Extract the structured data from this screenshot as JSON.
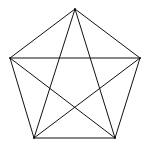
{
  "diagram": {
    "title": "",
    "type": "complete-graph-K5",
    "stroke_color": "#111111",
    "background": "#ffffff",
    "vertices": [
      {
        "id": "top",
        "x": 75,
        "y": 9
      },
      {
        "id": "right",
        "x": 140,
        "y": 58
      },
      {
        "id": "bottom-right",
        "x": 115,
        "y": 138
      },
      {
        "id": "bottom-left",
        "x": 34,
        "y": 138
      },
      {
        "id": "left",
        "x": 10,
        "y": 58
      }
    ],
    "edges": [
      [
        "top",
        "right"
      ],
      [
        "right",
        "bottom-right"
      ],
      [
        "bottom-right",
        "bottom-left"
      ],
      [
        "bottom-left",
        "left"
      ],
      [
        "left",
        "top"
      ],
      [
        "top",
        "bottom-right"
      ],
      [
        "top",
        "bottom-left"
      ],
      [
        "left",
        "right"
      ],
      [
        "left",
        "bottom-right"
      ],
      [
        "right",
        "bottom-left"
      ]
    ]
  }
}
